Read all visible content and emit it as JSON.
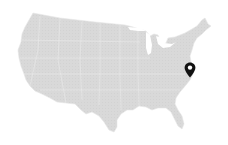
{
  "map": {
    "region": "United States (contiguous)",
    "fill_color": "#d9d9d9",
    "border_color": "#ececec",
    "background": "#ffffff"
  },
  "marker": {
    "icon": "map-pin-icon",
    "color": "#111111",
    "x": 190,
    "y": 76
  }
}
